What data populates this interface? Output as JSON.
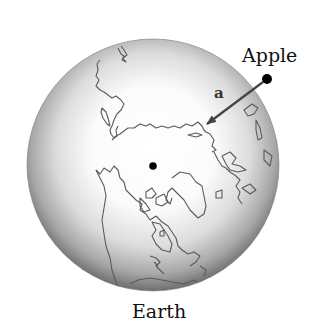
{
  "diagram": {
    "type": "physics-gravity-illustration",
    "labels": {
      "apple": "Apple",
      "earth": "Earth",
      "acceleration": "a"
    },
    "earth": {
      "center": [
        153,
        165
      ],
      "radius": 126,
      "view": "north-polar projection with continent outlines",
      "center_dot": [
        153,
        166
      ]
    },
    "apple": {
      "position": [
        267,
        79
      ],
      "radius": 5
    },
    "arrow": {
      "from": [
        263,
        82
      ],
      "to": [
        206,
        125
      ],
      "meaning": "acceleration of apple toward Earth's center"
    },
    "colors": {
      "globe_rim": "#6e6e6e",
      "globe_highlight": "#ffffff",
      "coastline": "#5a5a5a",
      "arrow": "#444444",
      "dot": "#000000",
      "text": "#111111"
    }
  }
}
